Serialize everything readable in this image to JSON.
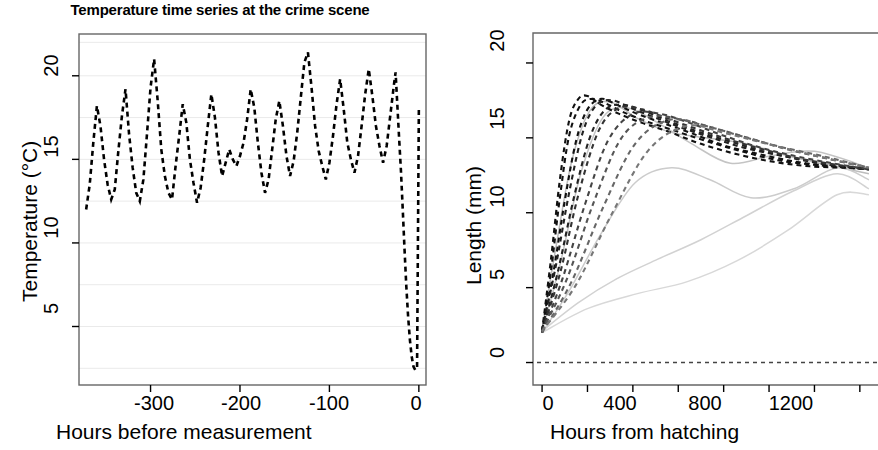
{
  "figure": {
    "background": "#ffffff",
    "width": 878,
    "height": 450
  },
  "panels": {
    "left": {
      "title": "Temperature time series at the crime scene",
      "xlabel": "Hours before measurement",
      "ylabel": "Temperature (°C)",
      "xticks": [
        "-300",
        "-200",
        "-100",
        "0"
      ],
      "yticks": [
        "5",
        "10",
        "15",
        "20"
      ]
    },
    "right": {
      "title": "",
      "xlabel": "Hours from hatching",
      "ylabel": "Length (mm)",
      "xticks": [
        "0",
        "400",
        "800",
        "1200"
      ],
      "yticks": [
        "0",
        "5",
        "10",
        "15",
        "20"
      ]
    }
  },
  "colors": {
    "line": "#000000",
    "grid": "#eaeaea",
    "frame": "#666666",
    "faint_curve": "#c8c8c8",
    "mid_curve": "#9a9a9a"
  },
  "chart_data": [
    {
      "type": "line",
      "id": "temperature-time-series",
      "title": "Temperature time series at the crime scene",
      "xlabel": "Hours before measurement",
      "ylabel": "Temperature (°C)",
      "xlim": [
        -380,
        8
      ],
      "ylim": [
        1.5,
        22.5
      ],
      "xticks": [
        -300,
        -200,
        -100,
        0
      ],
      "yticks": [
        5,
        10,
        15,
        20
      ],
      "grid": true,
      "linestyle": "dashed",
      "legend": "none",
      "series": [
        {
          "name": "Ambient temperature",
          "x": [
            -372,
            -368,
            -364,
            -360,
            -356,
            -352,
            -348,
            -344,
            -340,
            -336,
            -332,
            -328,
            -324,
            -320,
            -316,
            -312,
            -308,
            -304,
            -300,
            -296,
            -292,
            -288,
            -284,
            -280,
            -276,
            -272,
            -268,
            -264,
            -260,
            -256,
            -252,
            -248,
            -244,
            -240,
            -236,
            -232,
            -228,
            -224,
            -220,
            -216,
            -212,
            -208,
            -204,
            -200,
            -196,
            -192,
            -188,
            -184,
            -180,
            -176,
            -172,
            -168,
            -164,
            -160,
            -156,
            -152,
            -148,
            -144,
            -140,
            -136,
            -132,
            -128,
            -124,
            -120,
            -116,
            -112,
            -108,
            -104,
            -100,
            -96,
            -92,
            -88,
            -84,
            -80,
            -76,
            -72,
            -68,
            -64,
            -60,
            -56,
            -52,
            -48,
            -44,
            -40,
            -36,
            -32,
            -28,
            -26,
            -24,
            -22,
            -20,
            -18,
            -16,
            -14,
            -12,
            -10,
            -8,
            -6,
            -4,
            -2,
            0
          ],
          "y": [
            12.0,
            13.5,
            16.0,
            18.2,
            17.0,
            15.0,
            13.5,
            12.6,
            13.2,
            15.5,
            17.6,
            19.2,
            16.5,
            14.5,
            13.0,
            12.5,
            13.8,
            16.5,
            19.3,
            21.0,
            18.5,
            15.6,
            14.0,
            13.0,
            12.6,
            14.6,
            16.4,
            18.3,
            17.2,
            15.0,
            13.6,
            12.4,
            13.3,
            15.0,
            17.0,
            18.9,
            17.5,
            15.4,
            14.0,
            14.8,
            15.6,
            15.0,
            14.6,
            15.2,
            16.0,
            17.4,
            19.2,
            18.1,
            16.0,
            14.2,
            13.0,
            13.8,
            15.6,
            17.4,
            18.5,
            17.0,
            15.2,
            14.0,
            14.9,
            16.6,
            18.7,
            20.8,
            21.4,
            19.3,
            17.0,
            15.5,
            14.6,
            13.8,
            14.8,
            16.4,
            18.3,
            19.8,
            18.0,
            16.0,
            15.0,
            14.2,
            15.2,
            17.0,
            18.9,
            20.4,
            18.8,
            17.0,
            15.8,
            14.8,
            15.8,
            17.6,
            19.4,
            20.2,
            18.2,
            16.2,
            14.3,
            12.0,
            9.6,
            7.4,
            5.6,
            4.2,
            3.2,
            2.6,
            2.4,
            2.5,
            18.0
          ],
          "notes": "Strong daily oscillation roughly between 12 and 21 degrees C for most of the record, followed by a sharp drop to about 2.5 degrees C in the final ~20 hours and a near-vertical dashed return to about 18 degrees C at hour 0."
        }
      ]
    },
    {
      "type": "line",
      "id": "larval-length-growth-curves",
      "title": "",
      "xlabel": "Hours from hatching",
      "ylabel": "Length (mm)",
      "xlim": [
        -40,
        1480
      ],
      "ylim": [
        -1.5,
        22.0
      ],
      "xticks": [
        0,
        400,
        800,
        1200
      ],
      "xticks_minor": [
        200,
        600,
        1000,
        1400
      ],
      "yticks": [
        0,
        5,
        10,
        15,
        20
      ],
      "grid": false,
      "legend": "none",
      "reference_line": {
        "y": 0,
        "style": "dashed",
        "color": "#444444"
      },
      "series": [
        {
          "name": "curve-1",
          "style": "dashed",
          "color": "#111111",
          "x": [
            0,
            40,
            80,
            120,
            160,
            200,
            260,
            340,
            440,
            560,
            700,
            860,
            1020,
            1180,
            1340,
            1440
          ],
          "y": [
            2.1,
            7.0,
            12.4,
            16.2,
            17.6,
            17.8,
            17.2,
            16.6,
            16.0,
            15.4,
            14.6,
            13.9,
            13.4,
            13.1,
            13.0,
            12.9
          ]
        },
        {
          "name": "curve-2",
          "style": "dashed",
          "color": "#111111",
          "x": [
            0,
            40,
            80,
            120,
            170,
            220,
            280,
            360,
            460,
            580,
            720,
            880,
            1040,
            1200,
            1360,
            1440
          ],
          "y": [
            2.0,
            6.2,
            11.2,
            15.2,
            17.2,
            17.6,
            17.3,
            16.7,
            16.1,
            15.5,
            14.8,
            14.1,
            13.5,
            13.2,
            13.0,
            12.9
          ]
        },
        {
          "name": "curve-3",
          "style": "dashed",
          "color": "#111111",
          "x": [
            0,
            50,
            100,
            150,
            200,
            260,
            330,
            420,
            530,
            660,
            800,
            960,
            1120,
            1280,
            1420
          ],
          "y": [
            2.1,
            6.0,
            10.8,
            14.8,
            16.9,
            17.6,
            17.2,
            16.6,
            16.0,
            15.3,
            14.5,
            13.9,
            13.4,
            13.1,
            13.0
          ]
        },
        {
          "name": "curve-4",
          "style": "dashed",
          "color": "#222222",
          "x": [
            0,
            60,
            120,
            180,
            240,
            310,
            390,
            490,
            610,
            750,
            900,
            1060,
            1220,
            1380,
            1440
          ],
          "y": [
            2.2,
            6.4,
            11.4,
            15.4,
            17.2,
            17.5,
            17.0,
            16.4,
            15.7,
            15.0,
            14.3,
            13.8,
            13.3,
            13.0,
            12.9
          ]
        },
        {
          "name": "curve-5",
          "style": "dashed",
          "color": "#222222",
          "x": [
            0,
            70,
            140,
            210,
            280,
            360,
            450,
            560,
            690,
            840,
            1000,
            1160,
            1320,
            1440
          ],
          "y": [
            2.0,
            6.1,
            11.0,
            15.0,
            16.9,
            17.2,
            16.8,
            16.1,
            15.4,
            14.7,
            14.0,
            13.5,
            13.1,
            12.9
          ]
        },
        {
          "name": "curve-6",
          "style": "dashed",
          "color": "#333333",
          "x": [
            0,
            80,
            160,
            250,
            340,
            440,
            550,
            680,
            820,
            980,
            1140,
            1300,
            1440
          ],
          "y": [
            2.1,
            6.0,
            11.2,
            15.5,
            17.0,
            16.9,
            16.3,
            15.6,
            14.9,
            14.2,
            13.6,
            13.2,
            12.9
          ]
        },
        {
          "name": "curve-7",
          "style": "dashed",
          "color": "#444444",
          "x": [
            0,
            90,
            190,
            290,
            400,
            520,
            650,
            790,
            950,
            1110,
            1280,
            1440
          ],
          "y": [
            2.0,
            5.6,
            10.6,
            14.8,
            16.6,
            16.6,
            16.0,
            15.2,
            14.4,
            13.8,
            13.3,
            12.9
          ]
        },
        {
          "name": "curve-8",
          "style": "dashed",
          "color": "#555555",
          "x": [
            0,
            110,
            230,
            350,
            480,
            620,
            770,
            930,
            1090,
            1260,
            1440
          ],
          "y": [
            2.1,
            5.6,
            10.8,
            15.0,
            16.4,
            16.2,
            15.6,
            14.9,
            14.2,
            13.6,
            13.0
          ]
        },
        {
          "name": "curve-9",
          "style": "dashed",
          "color": "#666666",
          "x": [
            0,
            130,
            270,
            410,
            560,
            720,
            880,
            1050,
            1230,
            1440
          ],
          "y": [
            2.0,
            5.4,
            10.4,
            14.6,
            16.2,
            15.8,
            15.1,
            14.4,
            13.8,
            13.0
          ]
        },
        {
          "name": "curve-10",
          "style": "dashed",
          "color": "#777777",
          "x": [
            0,
            150,
            310,
            470,
            640,
            810,
            990,
            1180,
            1440
          ],
          "y": [
            2.1,
            5.2,
            10.0,
            14.2,
            15.8,
            15.3,
            14.6,
            13.9,
            13.0
          ]
        },
        {
          "name": "curve-11",
          "style": "solid",
          "color": "#bdbdbd",
          "x": [
            0,
            60,
            130,
            210,
            300,
            420,
            560,
            720,
            900,
            1080,
            1260,
            1440
          ],
          "y": [
            2.2,
            7.6,
            13.4,
            16.8,
            17.4,
            16.3,
            15.4,
            15.0,
            14.6,
            13.8,
            13.2,
            12.6
          ]
        },
        {
          "name": "curve-12",
          "style": "solid",
          "color": "#c4c4c4",
          "x": [
            0,
            80,
            170,
            270,
            380,
            510,
            660,
            830,
            1010,
            1200,
            1440
          ],
          "y": [
            2.1,
            6.6,
            12.6,
            16.4,
            17.0,
            16.0,
            14.6,
            13.3,
            13.8,
            14.1,
            13.0
          ]
        },
        {
          "name": "curve-13",
          "style": "solid",
          "color": "#cccccc",
          "x": [
            0,
            120,
            260,
            410,
            570,
            740,
            920,
            1110,
            1300,
            1440
          ],
          "y": [
            2.0,
            4.8,
            8.6,
            12.0,
            13.0,
            12.2,
            11.0,
            11.6,
            13.0,
            12.2
          ]
        },
        {
          "name": "curve-14",
          "style": "solid",
          "color": "#d2d2d2",
          "x": [
            0,
            160,
            330,
            510,
            700,
            900,
            1100,
            1300,
            1440
          ],
          "y": [
            2.1,
            4.0,
            5.6,
            6.9,
            8.2,
            9.8,
            11.4,
            12.6,
            11.6
          ]
        },
        {
          "name": "curve-15",
          "style": "solid",
          "color": "#d8d8d8",
          "x": [
            0,
            200,
            420,
            640,
            860,
            1080,
            1300,
            1440
          ],
          "y": [
            2.0,
            3.6,
            4.6,
            5.4,
            6.8,
            8.8,
            11.2,
            11.2
          ]
        }
      ],
      "notes": "Family of larval growth curves: rapid rise from about 2 mm at hatching to a peak of 17-18 mm between roughly 100 and 400 hours, followed by a gradual decline converging near 11-13 mm by 1400 hours. Darker dashed curves rise fastest; lighter gray solid curves rise more slowly. A dashed horizontal reference line is drawn at 0 mm."
    }
  ]
}
